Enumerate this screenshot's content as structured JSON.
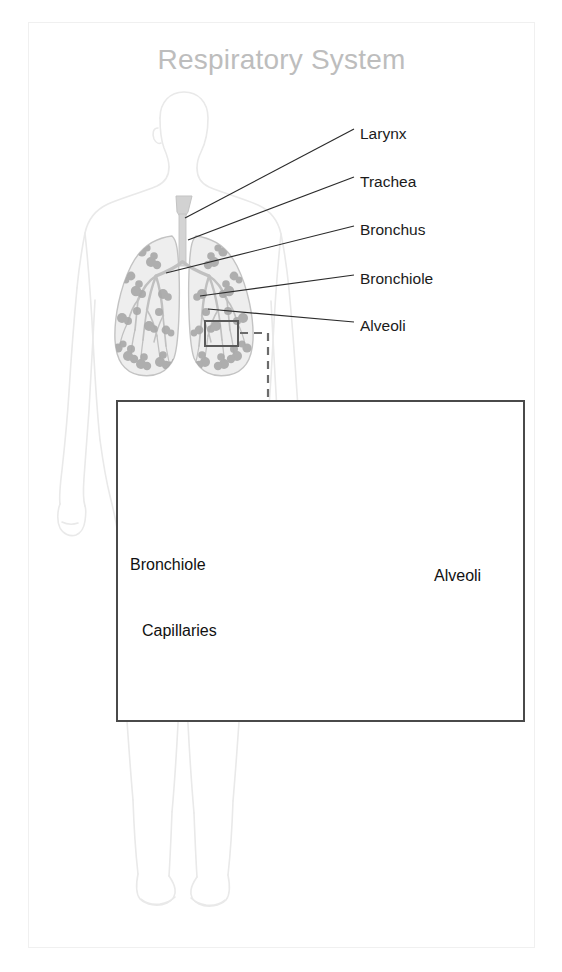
{
  "figure": {
    "title": "Respiratory System",
    "kind": "anatomical-diagram",
    "title_color": "#bdbdbd",
    "background_color": "#ffffff"
  },
  "colors": {
    "frame_border": "#f0f0f0",
    "body_outline": "#e8e8e8",
    "lung_fill": "#eeeeee",
    "lung_outline": "#c9c9c9",
    "airway_gray": "#c9c9c9",
    "alveoli_cluster_gray": "#a8a8a8",
    "leader_line": "#2b2b2b",
    "detail_border": "#4a4a4a",
    "detail_bronchiole": "#8f8f8f",
    "detail_alveoli": "#b8b8b8",
    "detail_vessel": "#6e6e6e",
    "detail_capillary": "#787878",
    "label_text": "#111111"
  },
  "main_diagram": {
    "name": "human-body-respiratory-overview",
    "callouts": [
      {
        "id": "larynx",
        "label": "Larynx",
        "label_x": 360,
        "label_y": 135,
        "leader": {
          "x1": 354,
          "y1": 129,
          "x2": 185,
          "y2": 218
        }
      },
      {
        "id": "trachea",
        "label": "Trachea",
        "label_x": 360,
        "label_y": 183,
        "leader": {
          "x1": 354,
          "y1": 177,
          "x2": 188,
          "y2": 240
        }
      },
      {
        "id": "bronchus",
        "label": "Bronchus",
        "label_x": 360,
        "label_y": 231,
        "leader": {
          "x1": 354,
          "y1": 226,
          "x2": 166,
          "y2": 273
        }
      },
      {
        "id": "bronchiole",
        "label": "Bronchiole",
        "label_x": 360,
        "label_y": 280,
        "leader": {
          "x1": 354,
          "y1": 275,
          "x2": 200,
          "y2": 296
        }
      },
      {
        "id": "alveoli",
        "label": "Alveoli",
        "label_x": 360,
        "label_y": 327,
        "leader": {
          "x1": 354,
          "y1": 322,
          "x2": 208,
          "y2": 309
        }
      }
    ],
    "zoom_box": {
      "x": 205,
      "y": 321,
      "width": 33,
      "height": 25
    },
    "dashed_connector": "from zoom box right, then down to detail box top"
  },
  "detail_diagram": {
    "name": "alveoli-capillary-detail",
    "labels": [
      {
        "id": "bronchiole",
        "label": "Bronchiole",
        "label_x": 130,
        "label_y": 565,
        "leader": {
          "x1": 196,
          "y1": 556,
          "x2": 216,
          "y2": 505
        }
      },
      {
        "id": "capillaries",
        "label": "Capillaries",
        "label_x": 142,
        "label_y": 635,
        "leader": {
          "x1": 247,
          "y1": 631,
          "x2": 297,
          "y2": 631
        }
      },
      {
        "id": "alveoli",
        "label": "Alveoli",
        "label_x": 434,
        "label_y": 578,
        "leader": {
          "x1": 432,
          "y1": 566,
          "x2": 388,
          "y2": 508
        }
      }
    ],
    "structures": [
      "bronchiole tube",
      "alveoli sac cluster",
      "capillary mesh spheres",
      "blood vessel"
    ]
  }
}
